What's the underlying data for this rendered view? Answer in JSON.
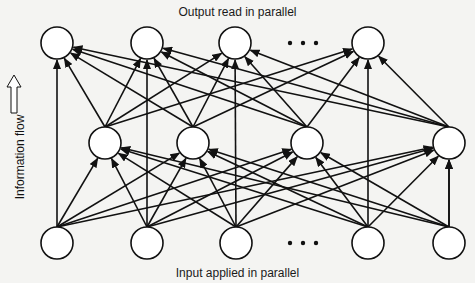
{
  "labels": {
    "top": "Output read in parallel",
    "bottom": "Input applied in parallel",
    "side": "Information flow"
  },
  "colors": {
    "background": "#f4f4f2",
    "stroke": "#111111",
    "node_fill": "#ffffff"
  },
  "layers": {
    "output": {
      "y": 43,
      "nodes": [
        57,
        147,
        235,
        368
      ],
      "ellipsis_x": 303
    },
    "hidden": {
      "y": 143,
      "nodes": [
        105,
        193,
        307,
        449
      ]
    },
    "input": {
      "y": 243,
      "nodes": [
        57,
        147,
        236,
        368,
        449
      ],
      "ellipsis_x": 303
    }
  },
  "node_radius": 16,
  "edges": {
    "input_to_hidden": "all",
    "hidden_to_output": "all",
    "input_to_output": "all"
  },
  "flow_arrow": {
    "direction": "up",
    "x": 14,
    "y_top": 75,
    "y_bottom": 113
  }
}
